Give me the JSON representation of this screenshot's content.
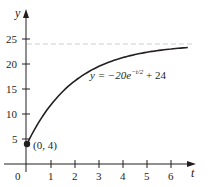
{
  "chart_data": {
    "type": "line",
    "title": "",
    "xlabel": "t",
    "ylabel": "y",
    "xlim": [
      0,
      7
    ],
    "ylim": [
      0,
      27
    ],
    "x_ticks": [
      1,
      2,
      3,
      4,
      5,
      6
    ],
    "y_ticks": [
      5,
      10,
      15,
      20,
      25
    ],
    "origin_label": "0",
    "grid": false,
    "legend": null,
    "series": [
      {
        "name": "y = -20e^(-t/2) + 24",
        "x": [
          0,
          0.5,
          1,
          1.5,
          2,
          2.5,
          3,
          3.5,
          4,
          4.5,
          5,
          5.5,
          6,
          6.5
        ],
        "values": [
          4.0,
          8.42,
          11.87,
          14.55,
          16.64,
          18.27,
          19.54,
          20.52,
          21.29,
          21.89,
          22.36,
          22.72,
          23.0,
          23.22
        ]
      }
    ],
    "asymptote": {
      "y": 24,
      "style": "dashed"
    },
    "annotations": [
      {
        "text": "(0, 4)",
        "x": 0,
        "y": 4,
        "marker": "filled-circle"
      },
      {
        "text": "y = −20e^(−t/2) + 24",
        "x": 3.4,
        "y": 18
      }
    ],
    "colors": {
      "curve": "#231f20",
      "axes": "#231f20",
      "asymptote": "#cfcfcf"
    }
  },
  "labels": {
    "y_axis": "y",
    "x_axis": "t",
    "origin": "0",
    "point": "(0, 4)",
    "eq_prefix": "y = −20e",
    "eq_exponent": "−t/2",
    "eq_suffix": " + 24",
    "y_ticks": [
      "5",
      "10",
      "15",
      "20",
      "25"
    ],
    "x_ticks": [
      "1",
      "2",
      "3",
      "4",
      "5",
      "6"
    ]
  }
}
